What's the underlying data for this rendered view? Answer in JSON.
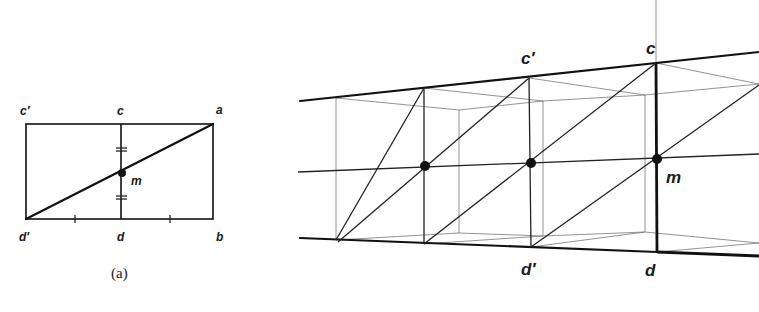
{
  "figure_a": {
    "caption": "(a)",
    "labels": {
      "c_prime": "c′",
      "c": "c",
      "a": "a",
      "m": "m",
      "d_prime": "d′",
      "d": "d",
      "b": "b"
    }
  },
  "figure_b": {
    "labels": {
      "c_prime": "c′",
      "c": "c",
      "m": "m",
      "d_prime": "d′",
      "d": "d"
    }
  }
}
